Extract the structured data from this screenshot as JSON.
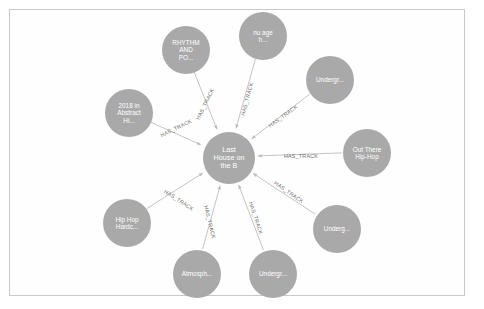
{
  "view": {
    "background_color": "#ffffff",
    "frame_border_color": "#c9c9c9",
    "node_color": "#a9a9a9",
    "node_text_color": "#ffffff",
    "edge_color": "#bdbdbd",
    "edge_label_color": "#6f6f6f"
  },
  "graph": {
    "center_node": {
      "label": "Last\nHouse on\nthe B",
      "x": 228,
      "y": 157,
      "r": 26,
      "font_size": 7.2
    },
    "relationship_label": "HAS_TRACK",
    "nodes": [
      {
        "name": "node-rhythm-and-po",
        "label": "RHYTHM\nAND\nPO...",
        "x": 185,
        "y": 49,
        "r": 24,
        "font_size": 6.4
      },
      {
        "name": "node-nu-age-h",
        "label": "nu age\nh...",
        "x": 262,
        "y": 35,
        "r": 24,
        "font_size": 6.4
      },
      {
        "name": "node-undergr-topright",
        "label": "Undergr...",
        "x": 329,
        "y": 79,
        "r": 24,
        "font_size": 6.4
      },
      {
        "name": "node-out-there-hiphop",
        "label": "Out There\nHip-Hop",
        "x": 366,
        "y": 152,
        "r": 24,
        "font_size": 6.4
      },
      {
        "name": "node-undergr-right",
        "label": "Underg...",
        "x": 336,
        "y": 228,
        "r": 24,
        "font_size": 6.4
      },
      {
        "name": "node-undergr-bottom",
        "label": "Undergr...",
        "x": 272,
        "y": 273,
        "r": 24,
        "font_size": 6.4
      },
      {
        "name": "node-atmosph",
        "label": "Atmosph...",
        "x": 196,
        "y": 273,
        "r": 24,
        "font_size": 6.4
      },
      {
        "name": "node-hip-hop-hardc",
        "label": "Hip Hop\nHardc...",
        "x": 126,
        "y": 222,
        "r": 24,
        "font_size": 6.4
      },
      {
        "name": "node-2018-in-abstract",
        "label": "2018 in\nAbstract\nHi...",
        "x": 128,
        "y": 112,
        "r": 24,
        "font_size": 6.4
      }
    ],
    "edges": [
      {
        "name": "edge-to-rhythm-and-po",
        "target": "node-rhythm-and-po",
        "label": "HAS_TRACK",
        "lx": 204,
        "ly": 103,
        "angle": 64
      },
      {
        "name": "edge-to-nu-age-h",
        "target": "node-nu-age-h",
        "label": "HAS_TRACK",
        "lx": 246,
        "ly": 98,
        "angle": 75
      },
      {
        "name": "edge-to-undergr-topright",
        "target": "node-undergr-topright",
        "label": "HAS_TRACK",
        "lx": 282,
        "ly": 115,
        "angle": 36
      },
      {
        "name": "edge-to-out-there-hiphop",
        "target": "node-out-there-hiphop",
        "label": "HAS_TRACK",
        "lx": 300,
        "ly": 155,
        "angle": 0
      },
      {
        "name": "edge-to-undergr-right",
        "target": "node-undergr-right",
        "label": "HAS_TRACK",
        "lx": 288,
        "ly": 191,
        "angle": -35
      },
      {
        "name": "edge-to-undergr-bottom",
        "target": "node-undergr-bottom",
        "label": "HAS_TRACK",
        "lx": 255,
        "ly": 217,
        "angle": -72
      },
      {
        "name": "edge-to-atmosph",
        "target": "node-atmosph",
        "label": "HAS_TRACK",
        "lx": 209,
        "ly": 221,
        "angle": -76
      },
      {
        "name": "edge-to-hip-hop-hardc",
        "target": "node-hip-hop-hardc",
        "label": "HAS_TRACK",
        "lx": 178,
        "ly": 199,
        "angle": -33
      },
      {
        "name": "edge-to-2018-in-abstract",
        "target": "node-2018-in-abstract",
        "label": "HAS_TRACK",
        "lx": 175,
        "ly": 127,
        "angle": 26
      }
    ]
  }
}
